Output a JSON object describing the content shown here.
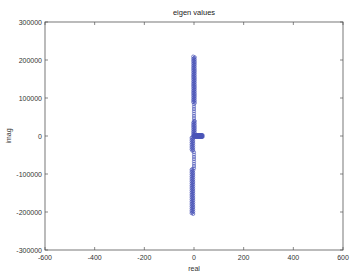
{
  "chart_data": {
    "type": "scatter",
    "title": "eigen values",
    "xlabel": "real",
    "ylabel": "imag",
    "xlim": [
      -600,
      600
    ],
    "ylim": [
      -300000,
      300000
    ],
    "xticks": [
      -600,
      -400,
      -200,
      0,
      200,
      400,
      600
    ],
    "yticks": [
      -300000,
      -200000,
      -100000,
      0,
      100000,
      200000,
      300000
    ],
    "xtick_labels": [
      "-600",
      "-400",
      "-200",
      "0",
      "200",
      "400",
      "600"
    ],
    "ytick_labels": [
      "-300000",
      "-200000",
      "-100000",
      "0",
      "100000",
      "200000",
      "300000"
    ],
    "grid": false,
    "legend": null,
    "marker": "circle (hollow)",
    "color": "#4a55b8",
    "series": [
      {
        "name": "eigenvalues",
        "description": "Dense column of eigenvalues near real=0 spanning imag from about -205000 to +210000, plus a short horizontal branch along imag=0 from real 0 to about +35",
        "vertical_column": {
          "real": 0,
          "imag_min": -205000,
          "imag_max": 210000
        },
        "horizontal_branch": {
          "imag": 0,
          "real_min": 0,
          "real_max": 35
        },
        "sparse_regions_imag": [
          [
            40000,
            85000
          ],
          [
            -85000,
            -40000
          ]
        ]
      }
    ]
  }
}
